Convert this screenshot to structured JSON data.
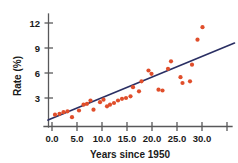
{
  "chart_data": {
    "type": "scatter",
    "title": "",
    "xlabel": "Years since 1950",
    "ylabel": "Rate (%)",
    "xlim": [
      -1.5,
      37.0
    ],
    "ylim": [
      0.0,
      13.2
    ],
    "grid": false,
    "legend": "none",
    "point_color": "#e04e2b",
    "line_color": "#2a2f63",
    "axis_color": "#58585a",
    "xticks": [
      0.0,
      5.0,
      10.0,
      15.0,
      20.0,
      25.0,
      30.0,
      35.0
    ],
    "xtick_labels": [
      "0.0",
      "5.0",
      "10.0",
      "15.0",
      "20.0",
      "25.0",
      "30.0",
      ""
    ],
    "yticks": [
      3,
      6,
      9,
      12
    ],
    "ytick_labels": [
      "3",
      "6",
      "9",
      "12"
    ],
    "series": [
      {
        "name": "observations",
        "points": [
          [
            0.6,
            1.0
          ],
          [
            1.5,
            1.1
          ],
          [
            2.3,
            1.3
          ],
          [
            3.1,
            1.4
          ],
          [
            4.0,
            0.7
          ],
          [
            5.4,
            1.5
          ],
          [
            6.3,
            2.2
          ],
          [
            7.0,
            2.3
          ],
          [
            7.7,
            2.7
          ],
          [
            8.3,
            1.6
          ],
          [
            9.6,
            2.5
          ],
          [
            10.3,
            2.8
          ],
          [
            11.0,
            2.0
          ],
          [
            11.6,
            2.2
          ],
          [
            12.4,
            2.4
          ],
          [
            13.2,
            2.7
          ],
          [
            14.0,
            2.9
          ],
          [
            14.8,
            3.0
          ],
          [
            15.7,
            3.2
          ],
          [
            16.2,
            4.3
          ],
          [
            17.4,
            3.8
          ],
          [
            17.9,
            5.0
          ],
          [
            19.3,
            6.3
          ],
          [
            19.9,
            5.9
          ],
          [
            21.3,
            4.0
          ],
          [
            22.1,
            3.9
          ],
          [
            23.2,
            6.5
          ],
          [
            23.8,
            7.4
          ],
          [
            25.7,
            5.5
          ],
          [
            26.1,
            4.8
          ],
          [
            27.6,
            5.0
          ],
          [
            28.0,
            7.0
          ],
          [
            29.1,
            10.0
          ],
          [
            30.1,
            11.5
          ]
        ]
      }
    ],
    "trend_line": {
      "name": "least-squares regression line",
      "x_start": -0.8,
      "y_start": 0.35,
      "x_end": 36.5,
      "y_end": 9.6
    }
  },
  "axes": {
    "y_axis_name": "rate-percent-axis",
    "x_axis_name": "years-since-1950-axis"
  }
}
